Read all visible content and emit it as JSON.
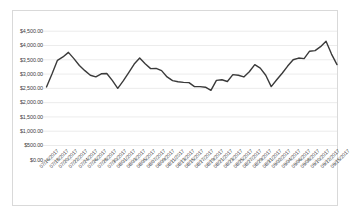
{
  "chart_data": {
    "type": "line",
    "title": "",
    "subtitle": "",
    "xlabel": "",
    "ylabel": "",
    "grid": true,
    "legend": false,
    "legend_position": "none",
    "line_color": "#3a3a3a",
    "gridline_color": "#e2e2e2",
    "border_color": "#d9d9d9",
    "axis_text_color": "#404040",
    "ylim": [
      0,
      4500
    ],
    "ytick_step": 500,
    "ytick_labels": [
      "$4,500.00",
      "$4,000.00",
      "$3,500.00",
      "$3,000.00",
      "$2,500.00",
      "$2,000.00",
      "$1,500.00",
      "$1,000.00",
      "$500.00",
      "$0.00"
    ],
    "ytick_values": [
      4500,
      4000,
      3500,
      3000,
      2500,
      2000,
      1500,
      1000,
      500,
      0
    ],
    "x_label_interval": 2,
    "xtick_labels": [
      "07/16/2017",
      "07/18/2017",
      "07/20/2017",
      "07/22/2017",
      "07/24/2017",
      "07/26/2017",
      "07/28/2017",
      "07/30/2017",
      "08/01/2017",
      "08/03/2017",
      "08/05/2017",
      "08/07/2017",
      "08/09/2017",
      "08/11/2017",
      "08/13/2017",
      "08/15/2017",
      "08/17/2017",
      "08/19/2017",
      "08/21/2017",
      "08/23/2017",
      "08/25/2017",
      "08/27/2017",
      "08/29/2017",
      "08/31/2017",
      "09/02/2017",
      "09/04/2017",
      "09/06/2017",
      "09/08/2017",
      "09/10/2017",
      "09/12/2017",
      "09/15/2017"
    ],
    "categories": [
      "07/16/2017",
      "07/17/2017",
      "07/18/2017",
      "07/19/2017",
      "07/20/2017",
      "07/21/2017",
      "07/22/2017",
      "07/23/2017",
      "07/24/2017",
      "07/25/2017",
      "07/26/2017",
      "07/27/2017",
      "07/28/2017",
      "07/29/2017",
      "07/30/2017",
      "07/31/2017",
      "08/01/2017",
      "08/02/2017",
      "08/03/2017",
      "08/04/2017",
      "08/05/2017",
      "08/06/2017",
      "08/07/2017",
      "08/08/2017",
      "08/09/2017",
      "08/10/2017",
      "08/11/2017",
      "08/12/2017",
      "08/13/2017",
      "08/14/2017",
      "08/15/2017",
      "08/16/2017",
      "08/17/2017",
      "08/18/2017",
      "08/19/2017",
      "08/20/2017",
      "08/21/2017",
      "08/22/2017",
      "08/23/2017",
      "08/24/2017",
      "08/25/2017",
      "08/26/2017",
      "08/27/2017",
      "08/28/2017",
      "08/29/2017",
      "08/30/2017",
      "08/31/2017",
      "09/02/2017",
      "09/04/2017",
      "09/06/2017",
      "09/08/2017",
      "09/10/2017",
      "09/12/2017",
      "09/15/2017"
    ],
    "series": [
      {
        "name": "Daily Sales",
        "values": [
          2550,
          3000,
          3480,
          3600,
          3760,
          3540,
          3300,
          3120,
          2960,
          2900,
          3010,
          3020,
          2780,
          2500,
          2760,
          3050,
          3350,
          3560,
          3360,
          3190,
          3200,
          3120,
          2900,
          2770,
          2730,
          2710,
          2700,
          2560,
          2560,
          2540,
          2430,
          2780,
          2800,
          2740,
          2980,
          2960,
          2900,
          3080,
          3330,
          3210,
          2960,
          2560,
          2800,
          3030,
          3280,
          3500,
          3560,
          3540,
          3800,
          3820,
          3960,
          4150,
          3700,
          3330
        ]
      }
    ]
  }
}
